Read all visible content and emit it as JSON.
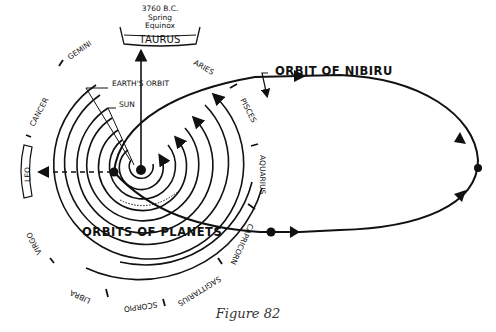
{
  "figure": {
    "caption": "Figure 82",
    "date_label": "3760 B.C.",
    "date_sub_1": "Spring",
    "date_sub_2": "Equinox"
  },
  "labels": {
    "earths_orbit": "EARTH'S ORBIT",
    "sun": "SUN",
    "orbit_of_nibiru": "ORBIT OF NIBIRU",
    "orbits_of_planets": "ORBITS OF PLANETS"
  },
  "zodiac": {
    "taurus": "TAURUS",
    "aries": "ARIES",
    "pisces": "PISCES",
    "aquarius": "AQUARIUS",
    "capricorn": "CAPRICORN",
    "sagittarius": "SAGITTARIUS",
    "scorpio": "SCORPIO",
    "libra": "LIBRA",
    "virgo": "VIRGO",
    "leo": "LEO",
    "cancer": "CANCER",
    "gemini": "GEMINI"
  },
  "colors": {
    "ink": "#111111",
    "background": "#ffffff"
  }
}
